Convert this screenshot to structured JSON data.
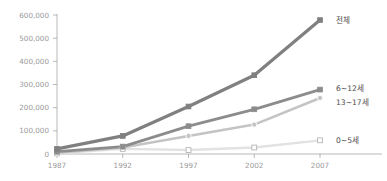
{
  "chart_data": {
    "type": "line",
    "title": "",
    "subtitle": "",
    "xlabel": "",
    "ylabel": "",
    "categories": [
      "1987",
      "1992",
      "1997",
      "2002",
      "2007"
    ],
    "x": [
      1987,
      1992,
      1997,
      2002,
      2007
    ],
    "ylim": [
      0,
      600000
    ],
    "yticks": [
      0,
      100000,
      200000,
      300000,
      400000,
      500000,
      600000
    ],
    "ytick_labels": [
      "0",
      "100,000",
      "200,000",
      "300,000",
      "400,000",
      "500,000",
      "600,000"
    ],
    "grid": false,
    "legend_position": "right-inline",
    "series": [
      {
        "name": "전체",
        "label": "전체",
        "color": "#808080",
        "marker": "square-filled",
        "line_width": 3.2,
        "values": [
          22000,
          78000,
          205000,
          340000,
          578000
        ]
      },
      {
        "name": "6~12세",
        "label": "6~12세",
        "color": "#8c8c8c",
        "marker": "square-filled",
        "line_width": 2.8,
        "values": [
          10000,
          32000,
          120000,
          193000,
          278000
        ]
      },
      {
        "name": "13~17세",
        "label": "13~17세",
        "color": "#c4c4c4",
        "marker": "circle-filled",
        "line_width": 2.6,
        "values": [
          6000,
          28000,
          78000,
          127000,
          242000
        ]
      },
      {
        "name": "0~5세",
        "label": "0~5세",
        "color": "#e2e2e2",
        "marker": "square-open",
        "line_width": 2.4,
        "values": [
          3000,
          22000,
          17000,
          28000,
          59000
        ]
      }
    ],
    "axis_color": "#a6a6a6",
    "tick_label_color": "#9a9a9a",
    "series_label_color": "#4d4d4d",
    "background": "#ffffff"
  }
}
